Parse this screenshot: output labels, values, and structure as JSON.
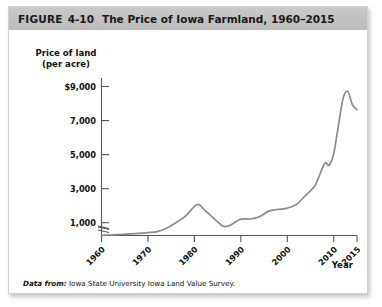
{
  "figure": {
    "label": "FIGURE",
    "number": "4-10",
    "title": "The Price of Iowa Farmland, 1960–2015"
  },
  "source": {
    "lead": "Data from:",
    "text": "Iowa State University Iowa Land Value Survey."
  },
  "chart_data": {
    "type": "line",
    "title": "The Price of Iowa Farmland, 1960–2015",
    "xlabel": "Year",
    "ylabel": "Price of land (per acre)",
    "ylabel_line1": "Price of land",
    "ylabel_line2": "(per acre)",
    "ytick_labels": [
      "$9,000",
      "7,000",
      "5,000",
      "3,000",
      "1,000"
    ],
    "ytick_values": [
      9000,
      7000,
      5000,
      3000,
      1000
    ],
    "xtick_labels": [
      "1960",
      "1970",
      "1980",
      "1990",
      "2000",
      "2010",
      "2015"
    ],
    "xtick_values": [
      1960,
      1970,
      1980,
      1990,
      2000,
      2010,
      2015
    ],
    "xlim": [
      1960,
      2015
    ],
    "ylim": [
      250,
      9500
    ],
    "y_axis_break": true,
    "grid": false,
    "legend": false,
    "series": [
      {
        "name": "Iowa farmland price per acre",
        "color": "#8c8c8c",
        "x": [
          1960,
          1962,
          1964,
          1966,
          1968,
          1970,
          1972,
          1974,
          1976,
          1978,
          1980,
          1981,
          1982,
          1984,
          1986,
          1987,
          1988,
          1990,
          1992,
          1994,
          1996,
          1998,
          2000,
          2002,
          2004,
          2006,
          2008,
          2009,
          2010,
          2011,
          2012,
          2013,
          2014,
          2015
        ],
        "y": [
          262,
          280,
          310,
          340,
          380,
          419,
          480,
          675,
          1000,
          1368,
          1960,
          2066,
          1800,
          1300,
          825,
          787,
          900,
          1214,
          1219,
          1356,
          1682,
          1781,
          1857,
          2083,
          2629,
          3204,
          4468,
          4371,
          5064,
          6708,
          8296,
          8716,
          7943,
          7633
        ]
      }
    ],
    "peak": {
      "year": 2013,
      "value": 8716
    },
    "local_peak_1981": {
      "year": 1981,
      "value": 2066
    },
    "trough_1987": {
      "year": 1987,
      "value": 787
    }
  }
}
